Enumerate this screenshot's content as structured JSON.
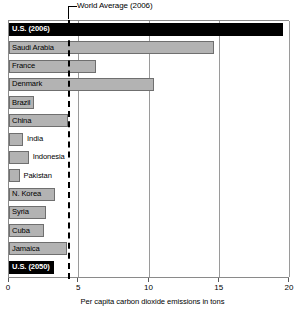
{
  "chart_data": {
    "type": "bar",
    "orientation": "horizontal",
    "title": "",
    "xlabel": "Per capita carbon dioxide emissions in tons",
    "ylabel": "",
    "xlim": [
      0,
      20
    ],
    "xticks": [
      0,
      5,
      10,
      15,
      20
    ],
    "xticklabels": [
      "0",
      "5",
      "10",
      "15",
      "20"
    ],
    "grid": true,
    "grid_axis": "x",
    "legend": null,
    "categories": [
      "U.S. (2006)",
      "Saudi Arabia",
      "France",
      "Denmark",
      "Brazil",
      "China",
      "India",
      "Indonesia",
      "Pakistan",
      "N. Korea",
      "Syria",
      "Cuba",
      "Jamaica",
      "U.S. (2050)"
    ],
    "values": [
      19.5,
      14.6,
      6.2,
      10.3,
      1.8,
      4.2,
      1.0,
      1.4,
      0.75,
      3.3,
      2.6,
      2.5,
      4.1,
      3.2
    ],
    "annotations": [
      {
        "name": "world-average-2006",
        "label": "World Average (2006)",
        "value": 4.3,
        "style": "dashed-vertical-line"
      }
    ],
    "colors": {
      "bar_fill": "#b3b3b3",
      "bar_edge": "#6f6f6f",
      "highlight_fill": "#000000",
      "highlight_text": "#ffffff",
      "grid": "#9a9a9a",
      "frame": "#8a8a8a",
      "text": "#000000",
      "background": "#ffffff"
    }
  },
  "bars": [
    {
      "label": "U.S. (2006)",
      "value": 19.5,
      "highlight": true,
      "label_position": "inside"
    },
    {
      "label": "Saudi Arabia",
      "value": 14.6,
      "highlight": false,
      "label_position": "inside"
    },
    {
      "label": "France",
      "value": 6.2,
      "highlight": false,
      "label_position": "inside"
    },
    {
      "label": "Denmark",
      "value": 10.3,
      "highlight": false,
      "label_position": "inside"
    },
    {
      "label": "Brazil",
      "value": 1.8,
      "highlight": false,
      "label_position": "inside"
    },
    {
      "label": "China",
      "value": 4.2,
      "highlight": false,
      "label_position": "inside"
    },
    {
      "label": "India",
      "value": 1.0,
      "highlight": false,
      "label_position": "outside"
    },
    {
      "label": "Indonesia",
      "value": 1.4,
      "highlight": false,
      "label_position": "outside"
    },
    {
      "label": "Pakistan",
      "value": 0.75,
      "highlight": false,
      "label_position": "outside"
    },
    {
      "label": "N. Korea",
      "value": 3.3,
      "highlight": false,
      "label_position": "inside"
    },
    {
      "label": "Syria",
      "value": 2.6,
      "highlight": false,
      "label_position": "inside"
    },
    {
      "label": "Cuba",
      "value": 2.5,
      "highlight": false,
      "label_position": "inside"
    },
    {
      "label": "Jamaica",
      "value": 4.1,
      "highlight": false,
      "label_position": "inside"
    },
    {
      "label": "U.S. (2050)",
      "value": 3.2,
      "highlight": true,
      "label_position": "inside"
    }
  ],
  "axis": {
    "ticks": [
      "0",
      "5",
      "10",
      "15",
      "20"
    ],
    "tick_values": [
      0,
      5,
      10,
      15,
      20
    ],
    "title": "Per capita carbon dioxide emissions in tons"
  },
  "annotation": {
    "text": "World Average (2006)",
    "value": 4.3
  }
}
